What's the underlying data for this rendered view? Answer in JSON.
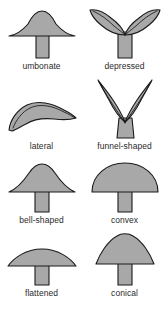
{
  "plate": {
    "background_color": "#ffffff",
    "fill_color": "#a8a8a8",
    "stroke_color": "#1a1a1a",
    "label_color": "#2b2b2b"
  },
  "figures": [
    {
      "id": "umbonate",
      "label": "umbonate",
      "icon": "mushroom-umbonate-icon",
      "description": "broad low cap with a central raised umbo and a straight stipe"
    },
    {
      "id": "depressed",
      "label": "depressed",
      "icon": "mushroom-depressed-icon",
      "description": "cap with upturned wing-like lobes and a sunken centre"
    },
    {
      "id": "lateral",
      "label": "lateral",
      "icon": "mushroom-lateral-icon",
      "description": "curved stalkless blade-like cap attached at one side"
    },
    {
      "id": "funnel-shaped",
      "label": "funnel-shaped",
      "icon": "mushroom-funnel-shaped-icon",
      "description": "deep V-shaped funnel cap with pointed margins"
    },
    {
      "id": "bell-shaped",
      "label": "bell-shaped",
      "icon": "mushroom-bell-shaped-icon",
      "description": "campanulate cap with rounded peak and flaring sides"
    },
    {
      "id": "convex",
      "label": "convex",
      "icon": "mushroom-convex-icon",
      "description": "smooth half-dome cap"
    },
    {
      "id": "flattened",
      "label": "flattened",
      "icon": "mushroom-flattened-icon",
      "description": "wide shallow plane cap"
    },
    {
      "id": "conical",
      "label": "conical",
      "icon": "mushroom-conical-icon",
      "description": "tall cone-shaped cap with rounded apex"
    }
  ]
}
